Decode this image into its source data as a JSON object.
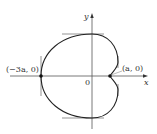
{
  "diagram": {
    "type": "polar-curve",
    "axes": {
      "x_label": "x",
      "y_label": "y",
      "origin_label": "0"
    },
    "points": [
      {
        "label": "(−3a, 0)",
        "x": -3,
        "y": 0
      },
      {
        "label": "(a, 0)",
        "x": 1,
        "y": 0
      }
    ],
    "colors": {
      "curve": "#222222",
      "axes": "#555555",
      "tangents": "#555555"
    }
  }
}
